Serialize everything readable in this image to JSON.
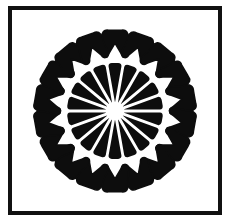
{
  "page": {
    "background_color": "#ffffff",
    "width": 233,
    "height": 224
  },
  "frame": {
    "name": "rectangular-border",
    "stroke_color": "#111111",
    "stroke_width": 4,
    "fill_color": "#ffffff",
    "left": 8,
    "top": 6,
    "width": 214,
    "height": 209
  },
  "artwork": {
    "name": "tooth-rosette",
    "description": "Radially symmetric rosette of stylized molar teeth around a small white hub",
    "ink_color": "#0d0d0d",
    "paper_color": "#ffffff",
    "petal_count": 18,
    "rotation_offset_deg": 0,
    "center": {
      "x": 116,
      "y": 112
    },
    "hub": {
      "name": "center-hub",
      "radius": 9,
      "fill": "#ffffff"
    },
    "inner_ring": {
      "name": "inner-wedge-ring",
      "inner_radius": 10,
      "outer_radius": 48,
      "half_angle_deg": 8.2,
      "tip_half_angle_deg": 1.6,
      "corner_round": 3
    },
    "outer_ring": {
      "name": "outer-tooth-ring",
      "crown_inner_radius": 55,
      "crown_outer_radius": 81,
      "crown_half_width": 13,
      "root_length": 16,
      "root_count": 2,
      "root_half_width": 4.2
    }
  },
  "chart_data": {
    "type": "pie",
    "categories": [
      "petal-1",
      "petal-2",
      "petal-3",
      "petal-4",
      "petal-5",
      "petal-6",
      "petal-7",
      "petal-8",
      "petal-9",
      "petal-10",
      "petal-11",
      "petal-12",
      "petal-13",
      "petal-14",
      "petal-15",
      "petal-16",
      "petal-17",
      "petal-18"
    ],
    "values": [
      20,
      20,
      20,
      20,
      20,
      20,
      20,
      20,
      20,
      20,
      20,
      20,
      20,
      20,
      20,
      20,
      20,
      20
    ],
    "angles_deg": [
      0,
      20,
      40,
      60,
      80,
      100,
      120,
      140,
      160,
      180,
      200,
      220,
      240,
      260,
      280,
      300,
      320,
      340
    ],
    "legend": [],
    "grid": false,
    "xlabel": "",
    "ylabel": ""
  }
}
